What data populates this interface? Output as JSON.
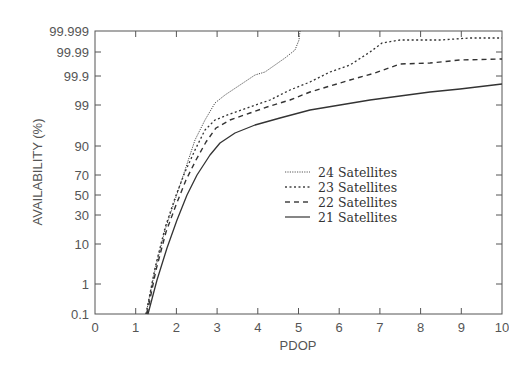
{
  "chart_data": {
    "type": "line",
    "title": "",
    "xlabel": "PDOP",
    "ylabel": "AVAILABILITY (%)",
    "xlim": [
      0,
      10
    ],
    "ylim": [
      0.1,
      99.999
    ],
    "yscale": "probability (normal-quantile)",
    "grid": false,
    "legend_position": "center-right inside plot",
    "x_ticks": [
      "0",
      "1",
      "2",
      "3",
      "4",
      "5",
      "6",
      "7",
      "8",
      "9",
      "10"
    ],
    "y_ticks": [
      "0.1",
      "1",
      "10",
      "30",
      "50",
      "70",
      "90",
      "99",
      "99.9",
      "99.99",
      "99.999"
    ],
    "series": [
      {
        "name": "24 Satellites",
        "style": "dotted-fine",
        "points": [
          [
            1.25,
            0.1
          ],
          [
            1.5,
            2
          ],
          [
            1.75,
            15
          ],
          [
            2.0,
            45
          ],
          [
            2.25,
            75
          ],
          [
            2.5,
            93
          ],
          [
            2.75,
            98
          ],
          [
            3.0,
            99.3
          ],
          [
            3.25,
            99.6
          ],
          [
            3.6,
            99.8
          ],
          [
            4.0,
            99.88
          ],
          [
            4.2,
            99.9
          ],
          [
            4.5,
            99.95
          ],
          [
            4.7,
            99.97
          ],
          [
            4.95,
            99.99
          ],
          [
            5.0,
            99.997
          ],
          [
            5.02,
            99.999
          ]
        ]
      },
      {
        "name": "23 Satellites",
        "style": "dotted",
        "points": [
          [
            1.25,
            0.1
          ],
          [
            1.5,
            2.2
          ],
          [
            1.75,
            16
          ],
          [
            2.0,
            48
          ],
          [
            2.25,
            72
          ],
          [
            2.5,
            87
          ],
          [
            2.75,
            95
          ],
          [
            3.0,
            97.5
          ],
          [
            3.3,
            98.3
          ],
          [
            3.8,
            99.0
          ],
          [
            4.3,
            99.5
          ],
          [
            4.8,
            99.75
          ],
          [
            5.3,
            99.85
          ],
          [
            5.8,
            99.93
          ],
          [
            6.3,
            99.96
          ],
          [
            6.8,
            99.985
          ],
          [
            7.05,
            99.993
          ],
          [
            7.5,
            99.995
          ],
          [
            8.5,
            99.995
          ],
          [
            9.2,
            99.996
          ],
          [
            10.0,
            99.996
          ]
        ]
      },
      {
        "name": "22 Satellites",
        "style": "dashed",
        "points": [
          [
            1.27,
            0.1
          ],
          [
            1.5,
            2
          ],
          [
            1.75,
            14
          ],
          [
            2.0,
            38
          ],
          [
            2.25,
            65
          ],
          [
            2.5,
            82
          ],
          [
            2.75,
            92
          ],
          [
            3.0,
            96.5
          ],
          [
            3.3,
            97.8
          ],
          [
            3.8,
            98.7
          ],
          [
            4.3,
            99.1
          ],
          [
            4.8,
            99.4
          ],
          [
            5.3,
            99.65
          ],
          [
            5.8,
            99.78
          ],
          [
            6.3,
            99.85
          ],
          [
            6.9,
            99.91
          ],
          [
            7.5,
            99.95
          ],
          [
            8.2,
            99.955
          ],
          [
            8.9,
            99.96
          ],
          [
            10.0,
            99.965
          ]
        ]
      },
      {
        "name": "21 Satellites",
        "style": "solid",
        "points": [
          [
            1.3,
            0.1
          ],
          [
            1.55,
            1
          ],
          [
            1.8,
            6
          ],
          [
            2.0,
            20
          ],
          [
            2.25,
            45
          ],
          [
            2.5,
            65
          ],
          [
            2.8,
            85
          ],
          [
            3.05,
            92
          ],
          [
            3.4,
            95.5
          ],
          [
            3.9,
            97.3
          ],
          [
            4.5,
            98.2
          ],
          [
            5.3,
            98.9
          ],
          [
            6.0,
            99.2
          ],
          [
            6.75,
            99.45
          ],
          [
            7.5,
            99.6
          ],
          [
            8.25,
            99.7
          ],
          [
            9.0,
            99.76
          ],
          [
            10.0,
            99.82
          ]
        ]
      }
    ]
  },
  "axes": {
    "x_title": "PDOP",
    "y_title": "AVAILABILITY (%)"
  },
  "legend": {
    "items": [
      {
        "label": "24 Satellites"
      },
      {
        "label": "23 Satellites"
      },
      {
        "label": "22 Satellites"
      },
      {
        "label": "21 Satellites"
      }
    ]
  },
  "layout_px": {
    "plot": {
      "left": 95,
      "right": 502,
      "top": 31,
      "bottom": 314
    },
    "y_tick_px": {
      "0.1": 314,
      "1": 284,
      "10": 244,
      "30": 215,
      "50": 195,
      "70": 175,
      "90": 146,
      "99": 105,
      "99.9": 76,
      "99.99": 52,
      "99.999": 31
    },
    "curves_px": [
      [
        [
          146,
          314
        ],
        [
          155,
          270
        ],
        [
          165,
          230
        ],
        [
          175,
          200
        ],
        [
          185,
          170
        ],
        [
          195,
          140
        ],
        [
          205,
          120
        ],
        [
          215,
          103
        ],
        [
          225,
          95
        ],
        [
          240,
          85
        ],
        [
          255,
          75
        ],
        [
          265,
          72
        ],
        [
          275,
          65
        ],
        [
          285,
          58
        ],
        [
          295,
          50
        ],
        [
          299,
          40
        ],
        [
          300,
          31
        ]
      ],
      [
        [
          146,
          314
        ],
        [
          155,
          268
        ],
        [
          165,
          228
        ],
        [
          175,
          198
        ],
        [
          185,
          172
        ],
        [
          195,
          150
        ],
        [
          205,
          130
        ],
        [
          215,
          120
        ],
        [
          230,
          114
        ],
        [
          250,
          107
        ],
        [
          270,
          100
        ],
        [
          290,
          90
        ],
        [
          310,
          82
        ],
        [
          330,
          72
        ],
        [
          350,
          65
        ],
        [
          370,
          52
        ],
        [
          382,
          43
        ],
        [
          400,
          40
        ],
        [
          440,
          40
        ],
        [
          470,
          38
        ],
        [
          502,
          38
        ]
      ],
      [
        [
          147,
          314
        ],
        [
          156,
          270
        ],
        [
          166,
          232
        ],
        [
          176,
          205
        ],
        [
          186,
          180
        ],
        [
          196,
          160
        ],
        [
          206,
          142
        ],
        [
          216,
          128
        ],
        [
          230,
          120
        ],
        [
          250,
          113
        ],
        [
          270,
          106
        ],
        [
          290,
          100
        ],
        [
          310,
          92
        ],
        [
          330,
          86
        ],
        [
          350,
          80
        ],
        [
          375,
          73
        ],
        [
          400,
          64
        ],
        [
          430,
          63
        ],
        [
          460,
          60
        ],
        [
          502,
          59
        ]
      ],
      [
        [
          148,
          314
        ],
        [
          157,
          280
        ],
        [
          167,
          248
        ],
        [
          177,
          220
        ],
        [
          187,
          195
        ],
        [
          197,
          175
        ],
        [
          210,
          155
        ],
        [
          220,
          143
        ],
        [
          235,
          133
        ],
        [
          255,
          125
        ],
        [
          280,
          118
        ],
        [
          310,
          110
        ],
        [
          340,
          105
        ],
        [
          370,
          100
        ],
        [
          400,
          96
        ],
        [
          430,
          92
        ],
        [
          460,
          89
        ],
        [
          502,
          84
        ]
      ]
    ],
    "dash": [
      "1.2,1.2",
      "2,2.5",
      "5,4",
      ""
    ],
    "stroke_w": [
      0.9,
      1.3,
      1.4,
      1.3
    ]
  }
}
